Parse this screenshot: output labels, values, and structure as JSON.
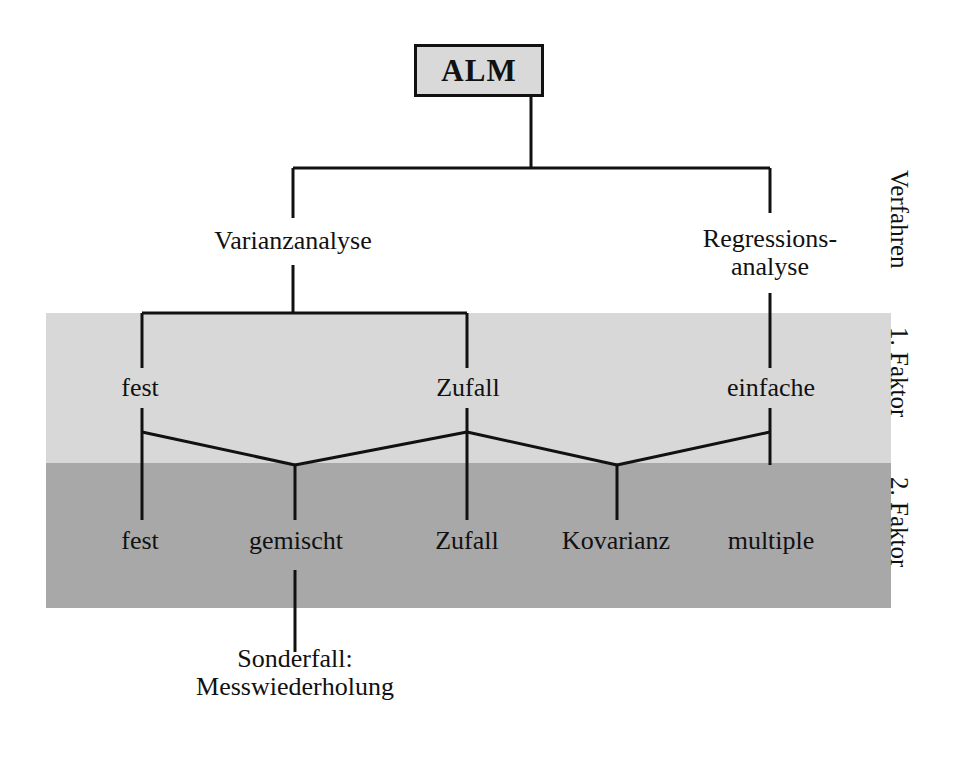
{
  "diagram": {
    "title": "ALM",
    "root": {
      "label": "ALM"
    },
    "level_verfahren": [
      {
        "label": "Varianzanalyse"
      },
      {
        "label_line1": "Regressions-",
        "label_line2": "analyse"
      }
    ],
    "level_faktor1": [
      {
        "label": "fest"
      },
      {
        "label": "Zufall"
      },
      {
        "label": "einfache"
      }
    ],
    "level_faktor2": [
      {
        "label": "fest"
      },
      {
        "label": "gemischt"
      },
      {
        "label": "Zufall"
      },
      {
        "label": "Kovarianz"
      },
      {
        "label": "multiple"
      }
    ],
    "footnote": {
      "line1": "Sonderfall:",
      "line2": "Messwiederholung"
    },
    "band_captions": [
      {
        "label": "Verfahren"
      },
      {
        "label": "1. Faktor"
      },
      {
        "label": "2. Faktor"
      }
    ],
    "colors": {
      "band_factor1": "#d8d8d8",
      "band_factor2": "#a8a8a8",
      "box_fill": "#d9d9d9",
      "line": "#111111",
      "page_background": "#ffffff"
    }
  }
}
